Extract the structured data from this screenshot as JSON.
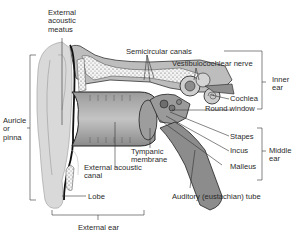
{
  "figure": {
    "colors": {
      "background": "#ffffff",
      "pinna": "#d9d9d9",
      "canal": "#a8a8a8",
      "bone": "#f2f2f2",
      "temporal": "#bdbdbd",
      "tube": "#8c8c8c",
      "outline": "#1a1a1a",
      "leader": "#333333",
      "text": "#2a2a2a"
    },
    "labels": {
      "external_acoustic_meatus": "External\nacoustic\nmeatus",
      "semicircular_canals": "Semicircular canals",
      "vestibulocochlear_nerve": "Vestibulocochlear nerve",
      "inner_ear": "Inner\near",
      "cochlea": "Cochlea",
      "round_window": "Round window",
      "auricle_or_pinna": "Auricle\nor\npinna",
      "tympanic_membrane": "Tympanic\nmembrane",
      "stapes": "Stapes",
      "incus": "Incus",
      "middle_ear": "Middle\near",
      "malleus": "Malleus",
      "external_acoustic_canal": "External acoustic\ncanal",
      "lobe": "Lobe",
      "auditory_tube": "Auditory (eustachian) tube",
      "external_ear": "External ear"
    }
  }
}
